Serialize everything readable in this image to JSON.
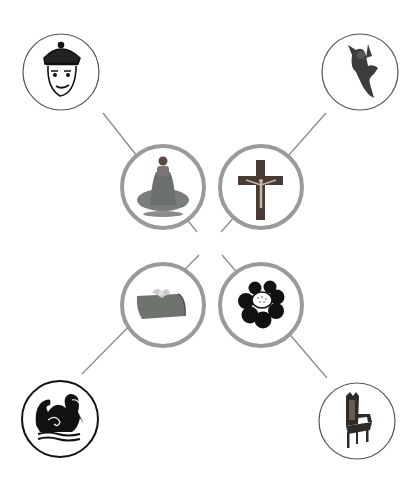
{
  "diagram": {
    "layout": "four inner circles arranged in a 2x2 grid, each connected by a diagonal line to an outer corner circle",
    "colors": {
      "background": "#ffffff",
      "inner_ring": "#9a9a9a",
      "outer_ring": "#555555",
      "connector": "#8c8c8c",
      "icon_dark": "#111111",
      "icon_mid": "#5a5a5a"
    },
    "inner_nodes": [
      {
        "id": "woman",
        "label": "seated woman in gown",
        "cx": 163,
        "cy": 187
      },
      {
        "id": "crucifix",
        "label": "crucifix",
        "cx": 261,
        "cy": 187
      },
      {
        "id": "gift",
        "label": "wrapped gift box",
        "cx": 163,
        "cy": 305
      },
      {
        "id": "flower",
        "label": "black flower emblem",
        "cx": 261,
        "cy": 305
      }
    ],
    "outer_nodes": [
      {
        "id": "king",
        "label": "crowned king face",
        "cx": 61,
        "cy": 72
      },
      {
        "id": "angel",
        "label": "cherub figurine",
        "cx": 360,
        "cy": 72
      },
      {
        "id": "swan",
        "label": "swan emblem",
        "cx": 60,
        "cy": 419
      },
      {
        "id": "throne",
        "label": "throne chair",
        "cx": 357,
        "cy": 421
      }
    ],
    "connections": [
      {
        "from": "woman",
        "to": "king"
      },
      {
        "from": "crucifix",
        "to": "angel"
      },
      {
        "from": "gift",
        "to": "swan"
      },
      {
        "from": "flower",
        "to": "throne"
      }
    ]
  }
}
